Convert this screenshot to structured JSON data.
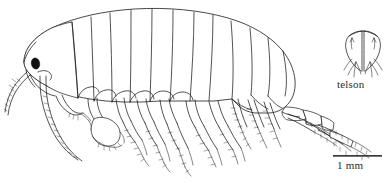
{
  "figure": {
    "kind": "scientific-line-drawing",
    "background_color": "#ffffff",
    "ink_color": "#1a1a1a",
    "width": 392,
    "height": 183
  },
  "labels": {
    "telson": "telson",
    "scale": "1 mm"
  },
  "scalebar": {
    "text": "1 mm",
    "x": 333,
    "y": 156,
    "length_px": 49,
    "color": "#3a3a3a"
  },
  "inset": {
    "name": "telson",
    "label": "telson",
    "x": 343,
    "y": 26,
    "width": 40,
    "height": 50
  },
  "anatomy": {
    "parts": [
      "head",
      "eye",
      "antenna-1",
      "antenna-2",
      "pereonite-1",
      "pereonite-2",
      "pereonite-3",
      "pereonite-4",
      "pereonite-5",
      "pereonite-6",
      "pereonite-7",
      "pleonite-1",
      "pleonite-2",
      "pleonite-3",
      "urosome",
      "gnathopod-1",
      "gnathopod-2",
      "pereopod-3",
      "pereopod-4",
      "pereopod-5",
      "pereopod-6",
      "pereopod-7",
      "pleopods",
      "uropods",
      "telson"
    ],
    "eye_color": "#111111"
  }
}
